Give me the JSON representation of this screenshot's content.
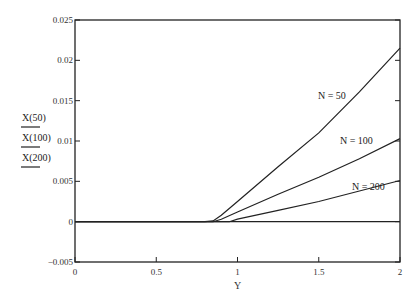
{
  "chart_data": {
    "type": "line",
    "title": "",
    "xlabel": "Y",
    "ylabel": "",
    "xlim": [
      0,
      2
    ],
    "ylim": [
      -0.005,
      0.025
    ],
    "grid": false,
    "x_ticks": [
      "0",
      "0.5",
      "1",
      "1.5",
      "2"
    ],
    "y_ticks": [
      "-0.005",
      "0",
      "0.005",
      "0.01",
      "0.015",
      "0.02",
      "0.025"
    ],
    "legend": [
      "X(50)",
      "X(100)",
      "X(200)"
    ],
    "legend_position": "left",
    "series": [
      {
        "name": "X(50)",
        "annotation": "N = 50",
        "x": [
          0,
          0.5,
          0.8,
          0.85,
          0.9,
          1.0,
          1.25,
          1.5,
          1.75,
          2.0
        ],
        "y": [
          0,
          0,
          0,
          0.0001,
          0.0008,
          0.0025,
          0.0068,
          0.011,
          0.0161,
          0.0215
        ]
      },
      {
        "name": "X(100)",
        "annotation": "N = 100",
        "x": [
          0,
          0.5,
          0.85,
          0.9,
          1.0,
          1.25,
          1.5,
          1.75,
          2.0
        ],
        "y": [
          0,
          0,
          0,
          0.0003,
          0.0012,
          0.0034,
          0.0055,
          0.0078,
          0.0103
        ]
      },
      {
        "name": "X(200)",
        "annotation": "N = 200",
        "x": [
          0,
          0.5,
          0.95,
          1.0,
          1.25,
          1.5,
          1.75,
          2.0
        ],
        "y": [
          0,
          0,
          0,
          0.0003,
          0.0014,
          0.0025,
          0.0038,
          0.0051
        ]
      }
    ]
  }
}
